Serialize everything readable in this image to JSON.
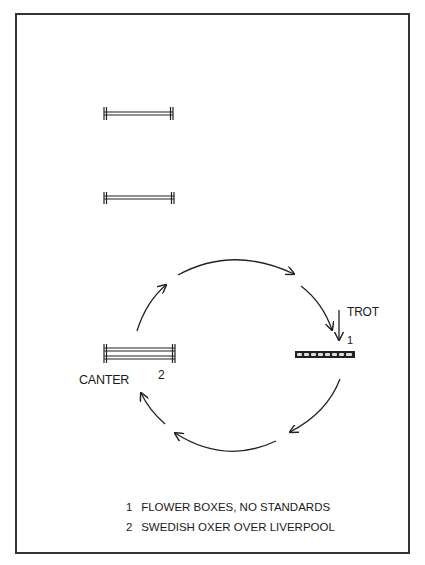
{
  "diagram": {
    "title": "",
    "labels": {
      "canter": "CANTER",
      "trot": "TROT",
      "fence_1_number": "1",
      "fence_2_number": "2"
    },
    "fences": [
      {
        "id": "rail-top",
        "type": "vertical rail",
        "position": "upper-left"
      },
      {
        "id": "rail-middle",
        "type": "vertical rail",
        "position": "middle-left"
      },
      {
        "id": "2",
        "type": "swedish oxer over liverpool",
        "position": "left on circle"
      },
      {
        "id": "1",
        "type": "flower boxes, no standards",
        "position": "right on circle"
      }
    ],
    "path": {
      "shape": "circle",
      "direction": "clockwise",
      "arrow_segments": 6
    },
    "legend": [
      {
        "number": "1",
        "text": "FLOWER BOXES, NO STANDARDS"
      },
      {
        "number": "2",
        "text": "SWEDISH OXER OVER LIVERPOOL"
      }
    ],
    "colors": {
      "line": "#222222",
      "background": "#ffffff",
      "border": "#333333"
    }
  }
}
